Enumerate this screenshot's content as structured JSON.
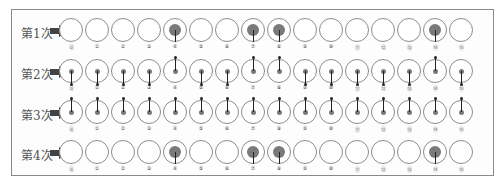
{
  "diagram": {
    "rows": [
      {
        "label": "第1次",
        "state": [
          0,
          0,
          0,
          0,
          1,
          0,
          0,
          1,
          1,
          0,
          0,
          0,
          0,
          0,
          1,
          0
        ]
      },
      {
        "label": "第2次",
        "state": [
          0,
          0,
          0,
          0,
          1,
          0,
          0,
          1,
          1,
          0,
          0,
          0,
          0,
          0,
          1,
          0
        ]
      },
      {
        "label": "第3次",
        "state": [
          0,
          0,
          0,
          0,
          0,
          0,
          0,
          0,
          0,
          0,
          0,
          0,
          0,
          0,
          0,
          0
        ]
      },
      {
        "label": "第4次",
        "state": [
          0,
          0,
          0,
          0,
          1,
          0,
          0,
          1,
          1,
          0,
          0,
          0,
          0,
          0,
          1,
          0
        ]
      }
    ],
    "row_styles": [
      "filled",
      "needle",
      "needle-up",
      "filled"
    ],
    "cell_labels": [
      "⓪",
      "①",
      "②",
      "③",
      "④",
      "⑤",
      "⑥",
      "⑦",
      "⑧",
      "⑨",
      "⑩",
      "⑪",
      "⑫",
      "⑬",
      "⑭",
      "⑮"
    ],
    "arrow_icon": "right-arrow-icon",
    "colors": {
      "frame": "#8a8a8a",
      "ring": "#8c8c8c",
      "fill": "#7a7a7a",
      "stem": "#222222"
    }
  }
}
